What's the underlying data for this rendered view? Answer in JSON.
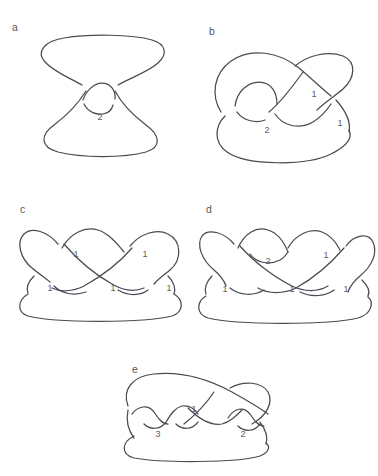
{
  "figure": {
    "background_color": "#ffffff",
    "stroke_color": "#4a4a52",
    "label_color": "#5a5a62",
    "width": 378,
    "height": 476
  },
  "panels": [
    {
      "id": "a",
      "letter": "a",
      "description": "Figure-eight style knot: two large lobes, upper and lower, joined through a single small clasp loop at the center.",
      "crossing_labels": [
        {
          "text": "2",
          "x": 74,
          "y": 90
        }
      ]
    },
    {
      "id": "b",
      "letter": "b",
      "description": "Pretzel-like knot with a large lower lobe, an upper-right loop and a small inner loop on the left.",
      "crossing_labels": [
        {
          "text": "1",
          "x": 111,
          "y": 69
        },
        {
          "text": "1",
          "x": 137,
          "y": 98
        },
        {
          "text": "2",
          "x": 64,
          "y": 105
        }
      ]
    },
    {
      "id": "c",
      "letter": "c",
      "description": "Braid closure with five crossings arranged in a two-row chain over a long bottom strand.",
      "crossing_labels": [
        {
          "text": "1",
          "x": 62,
          "y": 51
        },
        {
          "text": "1",
          "x": 131,
          "y": 51
        },
        {
          "text": "1",
          "x": 36,
          "y": 85
        },
        {
          "text": "1",
          "x": 99,
          "y": 85
        },
        {
          "text": "1",
          "x": 155,
          "y": 85
        }
      ]
    },
    {
      "id": "d",
      "letter": "d",
      "description": "Braid closure variant: a clasp labeled 2 near the top-left arch plus four single crossings.",
      "crossing_labels": [
        {
          "text": "2",
          "x": 72,
          "y": 58
        },
        {
          "text": "1",
          "x": 130,
          "y": 52
        },
        {
          "text": "1",
          "x": 29,
          "y": 86
        },
        {
          "text": "1",
          "x": 96,
          "y": 86
        },
        {
          "text": "1",
          "x": 150,
          "y": 86
        }
      ]
    },
    {
      "id": "e",
      "letter": "e",
      "description": "Two-lobed knot with a chain of small crossings along the middle; labels 3 on the left cluster, 1 at center, 2 on the right cluster.",
      "crossing_labels": [
        {
          "text": "1",
          "x": 84,
          "y": 48
        },
        {
          "text": "3",
          "x": 48,
          "y": 73
        },
        {
          "text": "2",
          "x": 133,
          "y": 73
        }
      ]
    }
  ]
}
